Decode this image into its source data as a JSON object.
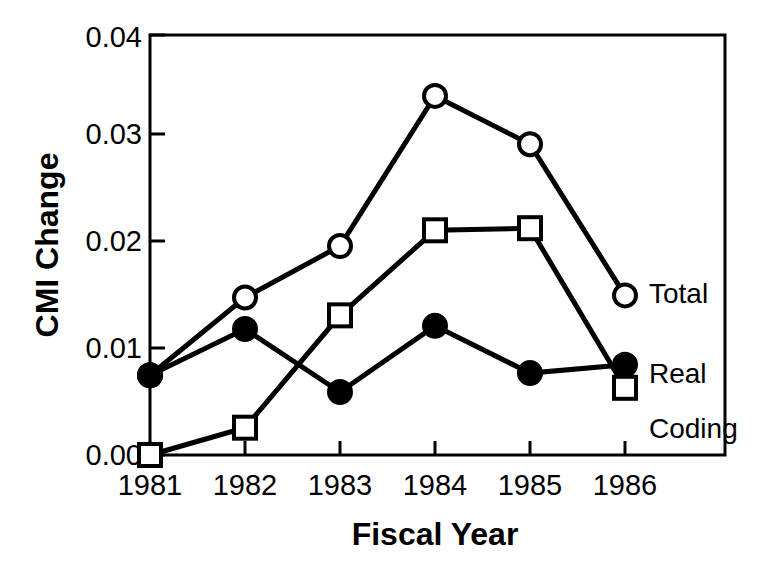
{
  "chart_data": {
    "type": "line",
    "title": "",
    "xlabel": "Fiscal Year",
    "ylabel": "CMI Change",
    "categories": [
      "1981",
      "1982",
      "1983",
      "1984",
      "1985",
      "1986"
    ],
    "x": [
      1981,
      1982,
      1983,
      1984,
      1985,
      1986
    ],
    "xlim": [
      1981,
      1986
    ],
    "ylim": [
      0.0,
      0.04
    ],
    "yticks": [
      "0.00",
      "0.01",
      "0.02",
      "0.03",
      "0.04"
    ],
    "ytick_values": [
      0.0,
      0.01,
      0.02,
      0.03,
      0.04
    ],
    "xticks": [
      "1981",
      "1982",
      "1983",
      "1984",
      "1985",
      "1986"
    ],
    "grid": false,
    "legend_position": "right-inline",
    "series": [
      {
        "name": "Total",
        "marker": "open-circle",
        "color": "#000000",
        "values": [
          0.0076,
          0.015,
          0.0199,
          0.0342,
          0.0296,
          0.0152
        ]
      },
      {
        "name": "Real",
        "marker": "filled-circle",
        "color": "#000000",
        "values": [
          0.0076,
          0.012,
          0.006,
          0.0123,
          0.0078,
          0.0086
        ]
      },
      {
        "name": "Coding",
        "marker": "open-square",
        "color": "#000000",
        "values": [
          0.0,
          0.0026,
          0.0133,
          0.0214,
          0.0216,
          0.0064
        ]
      }
    ],
    "annotations": [
      {
        "text": "Total",
        "series": "Total"
      },
      {
        "text": "Real",
        "series": "Real"
      },
      {
        "text": "Coding",
        "series": "Coding"
      }
    ]
  },
  "axes": {
    "y_title": "CMI Change",
    "x_title": "Fiscal Year"
  },
  "colors": {
    "foreground": "#000000",
    "background": "#ffffff"
  }
}
